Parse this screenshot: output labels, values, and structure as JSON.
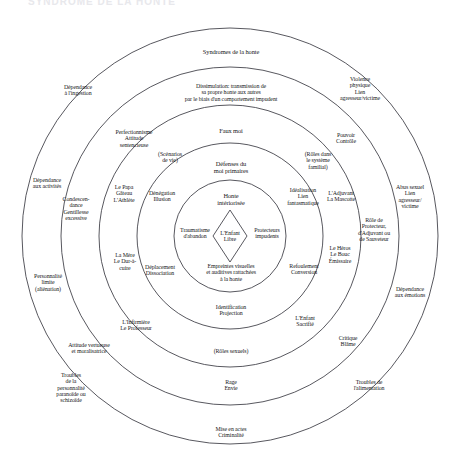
{
  "diagram": {
    "title_faint": "SYNDROME DE LA HONTE",
    "type": "concentric-rings",
    "center": {
      "x": 230,
      "y": 236
    },
    "radii": [
      208,
      169,
      131,
      93,
      56
    ],
    "core": {
      "diamond_label": "L'Enfant\nLibre"
    },
    "ring_names": [
      "symptomes-externes",
      "dissimulation",
      "faux-moi",
      "defenses-du-moi-primaires",
      "noyau-honte-interiorisee"
    ],
    "labels": [
      {
        "id": "syndromes-de-la-honte",
        "text": "Syndromes  de la honte",
        "x": 231,
        "y": 52,
        "size": "s7"
      },
      {
        "id": "dissimulation",
        "text": "Dissimulation: transmission de\nsa propre honte aux autres\npar le biais d'un comportement impudent",
        "x": 231,
        "y": 92,
        "size": "s65"
      },
      {
        "id": "dependance-a-l-ingestion",
        "text": "Dépendance\nà l'ingestion",
        "x": 78,
        "y": 90,
        "size": "s65"
      },
      {
        "id": "violence-physique",
        "text": "Violence\nphysique\nLien\nagresseur/victime",
        "x": 360,
        "y": 88,
        "size": "s65"
      },
      {
        "id": "faux-moi",
        "text": "Faux moi",
        "x": 231,
        "y": 131,
        "size": "s7"
      },
      {
        "id": "perfectionnisme",
        "text": "Perfectionnisme\nAttitude\nsentencieuse",
        "x": 134,
        "y": 138,
        "size": "s65"
      },
      {
        "id": "pouvoir-controle",
        "text": "Pouvoir\nContrôle",
        "x": 346,
        "y": 138,
        "size": "s65"
      },
      {
        "id": "scenarios-de-vie",
        "text": "(Scénarios\nde vie)",
        "x": 170,
        "y": 157,
        "size": "s65"
      },
      {
        "id": "roles-systeme-familial",
        "text": "(Rôles dans\nle système\nfamilial)",
        "x": 318,
        "y": 160,
        "size": "s65"
      },
      {
        "id": "defenses-du-moi-primaires",
        "text": "Défenses du\nmoi primaires",
        "x": 231,
        "y": 168,
        "size": "s7"
      },
      {
        "id": "dependance-aux-activites",
        "text": "Dépendance\naux activités",
        "x": 47,
        "y": 183,
        "size": "s65"
      },
      {
        "id": "abus-sexuel",
        "text": "Abus sexuel\nLien\nagresseur/\nvictime",
        "x": 410,
        "y": 196,
        "size": "s65"
      },
      {
        "id": "le-papa-gateau",
        "text": "Le Papa\nGâteau\nL'Athlète",
        "x": 124,
        "y": 193,
        "size": "s65"
      },
      {
        "id": "denegation-illusion",
        "text": "Dénégation\nIllusion",
        "x": 162,
        "y": 196,
        "size": "s65"
      },
      {
        "id": "idealisation",
        "text": "Idéalisation\nLien\nfantasmatique",
        "x": 303,
        "y": 196,
        "size": "s65"
      },
      {
        "id": "l-adjuvant-la-mascotte",
        "text": "L'Adjuvant\nLa Mascotte",
        "x": 341,
        "y": 196,
        "size": "s65"
      },
      {
        "id": "honte-interiorisee",
        "text": "Honte\nintériorisée",
        "x": 231,
        "y": 200,
        "size": "s7"
      },
      {
        "id": "condescendance",
        "text": "Condescen-\ndance\nGentillesse\nexcessive",
        "x": 76,
        "y": 208,
        "size": "s65"
      },
      {
        "id": "role-de-protecteur",
        "text": "Rôle de\nProtecteur,\nd'Adjuvant ou\nde Sauveteur",
        "x": 374,
        "y": 229,
        "size": "s65"
      },
      {
        "id": "traumatisme-d-abandon",
        "text": "Traumatisme\nd'abandon",
        "x": 195,
        "y": 233,
        "size": "s65"
      },
      {
        "id": "protecteurs-impudents",
        "text": "Protecteurs\nimpudents",
        "x": 267,
        "y": 233,
        "size": "s65"
      },
      {
        "id": "la-mere-le-dur-a-cuire",
        "text": "La Mère\nLe Dur-à-\ncuire",
        "x": 125,
        "y": 261,
        "size": "s65"
      },
      {
        "id": "le-heros-le-bouc-emissaire",
        "text": "Le Héros\nLe Bouc\nÉmissaire",
        "x": 340,
        "y": 254,
        "size": "s65"
      },
      {
        "id": "personnalite-limite",
        "text": "Personnalité\nlimite\n(aliénation)",
        "x": 48,
        "y": 282,
        "size": "s65"
      },
      {
        "id": "deplacement-dissociation",
        "text": "Déplacement\nDissociation",
        "x": 160,
        "y": 270,
        "size": "s65"
      },
      {
        "id": "refoulement-conversion",
        "text": "Refoulement\nConversion",
        "x": 304,
        "y": 269,
        "size": "s65"
      },
      {
        "id": "empreintes-visuelles",
        "text": "Empreintes visuelles\net auditives rattachées\nà la honte",
        "x": 231,
        "y": 272,
        "size": "s65"
      },
      {
        "id": "dependance-aux-emotions",
        "text": "Dépendance\naux émotions",
        "x": 410,
        "y": 292,
        "size": "s65"
      },
      {
        "id": "identification-projection",
        "text": "Identification\nProjection",
        "x": 231,
        "y": 310,
        "size": "s65"
      },
      {
        "id": "l-infirmiere-le-professeur",
        "text": "L'Infirmière\nLe Professeur",
        "x": 136,
        "y": 325,
        "size": "s65"
      },
      {
        "id": "l-enfant-sacrifie",
        "text": "L'Enfant\nSacrifié",
        "x": 305,
        "y": 321,
        "size": "s65"
      },
      {
        "id": "critique-blame",
        "text": "Critique\nBlâme",
        "x": 348,
        "y": 341,
        "size": "s65"
      },
      {
        "id": "attitude-vertueuse",
        "text": "Attitude vertueuse\net moralisatrice",
        "x": 89,
        "y": 348,
        "size": "s65"
      },
      {
        "id": "roles-sexuels",
        "text": "(Rôles sexuels)",
        "x": 231,
        "y": 351,
        "size": "s65"
      },
      {
        "id": "troubles-personnalite",
        "text": "Troubles\nde la\npersonnalité\nparanoïde ou\nschizoïde",
        "x": 71,
        "y": 388,
        "size": "s65"
      },
      {
        "id": "rage-envie",
        "text": "Rage\nEnvie",
        "x": 231,
        "y": 385,
        "size": "s65"
      },
      {
        "id": "troubles-alimentation",
        "text": "Troubles de\nl'alimentation",
        "x": 369,
        "y": 385,
        "size": "s65"
      },
      {
        "id": "mise-en-actes-criminalite",
        "text": "Mise en actes\nCriminalité",
        "x": 231,
        "y": 432,
        "size": "s65"
      }
    ]
  }
}
